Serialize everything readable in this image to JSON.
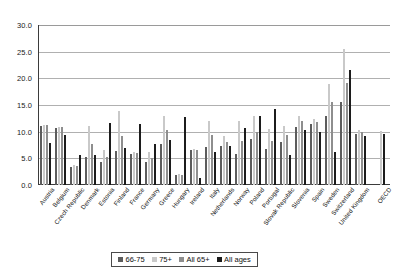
{
  "chart_data": {
    "type": "bar",
    "title": "",
    "subtitle": "",
    "xlabel": "",
    "ylabel": "",
    "ylim": [
      0,
      30
    ],
    "ytick_labels": [
      "0.0",
      "5.0",
      "10.0",
      "15.0",
      "20.0",
      "25.0",
      "30.0"
    ],
    "ytick_values": [
      0,
      5,
      10,
      15,
      20,
      25,
      30
    ],
    "grid": true,
    "legend_position": "bottom",
    "categories": [
      "Austria",
      "Belgium",
      "Czech Republic",
      "Denmark",
      "Estonia",
      "Finland",
      "France",
      "Germany",
      "Greece",
      "Hungary",
      "Ireland",
      "Italy",
      "Netherlands",
      "Norway",
      "Poland",
      "Portugal",
      "Slovak Republic",
      "Slovenia",
      "Spain",
      "Sweden",
      "Switzerland",
      "United Kingdom",
      "OECD"
    ],
    "series": [
      {
        "name": "66-75",
        "color": "#5c5c5c",
        "values": [
          11.0,
          10.7,
          3.4,
          5.3,
          4.4,
          6.4,
          5.9,
          4.3,
          7.7,
          1.9,
          6.6,
          7.2,
          7.3,
          5.8,
          8.7,
          6.8,
          8.1,
          10.9,
          11.5,
          12.9,
          15.6,
          9.6,
          null
        ]
      },
      {
        "name": "75+",
        "color": "#c9c9c9",
        "values": [
          11.3,
          10.8,
          3.8,
          11.0,
          6.5,
          13.8,
          6.1,
          6.1,
          13.0,
          2.0,
          6.7,
          12.0,
          9.2,
          12.0,
          13.0,
          10.5,
          11.0,
          13.0,
          12.3,
          19.0,
          25.5,
          10.3,
          10.2
        ]
      },
      {
        "name": "All 65+",
        "color": "#8e8e8e",
        "values": [
          11.2,
          10.8,
          3.6,
          7.6,
          5.2,
          9.2,
          6.0,
          5.1,
          10.3,
          1.9,
          6.6,
          9.3,
          8.1,
          8.3,
          10.0,
          8.3,
          9.3,
          12.0,
          11.8,
          15.5,
          19.2,
          9.9,
          null
        ]
      },
      {
        "name": "All ages",
        "color": "#1c1c1c",
        "values": [
          7.9,
          9.4,
          5.6,
          5.7,
          11.6,
          6.9,
          11.4,
          7.7,
          8.4,
          12.8,
          1.3,
          6.2,
          7.4,
          10.7,
          12.9,
          14.2,
          5.6,
          10.3,
          10.0,
          6.2,
          21.5,
          9.2,
          9.5
        ]
      }
    ]
  },
  "legend": {
    "items": [
      {
        "label": "66-75",
        "color": "#5c5c5c"
      },
      {
        "label": "75+",
        "color": "#c9c9c9"
      },
      {
        "label": "All 65+",
        "color": "#8e8e8e"
      },
      {
        "label": "All ages",
        "color": "#1c1c1c"
      }
    ]
  }
}
